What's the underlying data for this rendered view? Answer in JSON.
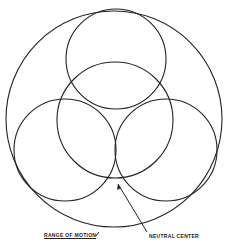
{
  "diagram": {
    "stroke_color": "#222222",
    "background": "#ffffff",
    "circles": [
      {
        "name": "range-of-motion-circle",
        "cx": 114,
        "cy": 119,
        "r": 108
      },
      {
        "name": "top-circle",
        "cx": 116,
        "cy": 59,
        "r": 50
      },
      {
        "name": "center-circle",
        "cx": 115,
        "cy": 120,
        "r": 58
      },
      {
        "name": "left-circle",
        "cx": 65,
        "cy": 150,
        "r": 51
      },
      {
        "name": "right-circle",
        "cx": 166,
        "cy": 150,
        "r": 51
      }
    ],
    "arrow": {
      "from": [
        147,
        232
      ],
      "to": [
        118,
        184
      ]
    },
    "labels": {
      "range_of_motion": "Range of motion",
      "neutral_center": "Neutral center"
    }
  }
}
